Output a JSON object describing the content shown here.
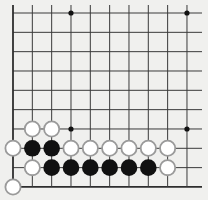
{
  "board": {
    "view": "bottom-left corner fragment",
    "columns": 10,
    "rows": 10,
    "origin_x": 13,
    "origin_y": 13,
    "step": 19.33,
    "line_right": 202,
    "line_top": 5,
    "edges": [
      "left",
      "bottom"
    ],
    "colors": {
      "background": "#f0f0ee",
      "line": "#3a3a3a",
      "edge_line": "#2e2e2e",
      "black_stone": "#111111",
      "white_stone_fill": "#ffffff",
      "white_stone_stroke": "#9a9a9a",
      "star": "#111111"
    },
    "star_points": [
      {
        "col": 3,
        "row": 0
      },
      {
        "col": 9,
        "row": 0
      },
      {
        "col": 3,
        "row": 6
      },
      {
        "col": 9,
        "row": 6
      }
    ],
    "stones": [
      {
        "color": "white",
        "col": 1,
        "row": 6
      },
      {
        "color": "white",
        "col": 2,
        "row": 6
      },
      {
        "color": "white",
        "col": 0,
        "row": 7
      },
      {
        "color": "black",
        "col": 1,
        "row": 7
      },
      {
        "color": "black",
        "col": 2,
        "row": 7
      },
      {
        "color": "white",
        "col": 3,
        "row": 7
      },
      {
        "color": "white",
        "col": 4,
        "row": 7
      },
      {
        "color": "white",
        "col": 5,
        "row": 7
      },
      {
        "color": "white",
        "col": 6,
        "row": 7
      },
      {
        "color": "white",
        "col": 7,
        "row": 7
      },
      {
        "color": "white",
        "col": 8,
        "row": 7
      },
      {
        "color": "white",
        "col": 1,
        "row": 8
      },
      {
        "color": "black",
        "col": 2,
        "row": 8
      },
      {
        "color": "black",
        "col": 3,
        "row": 8
      },
      {
        "color": "black",
        "col": 4,
        "row": 8
      },
      {
        "color": "black",
        "col": 5,
        "row": 8
      },
      {
        "color": "black",
        "col": 6,
        "row": 8
      },
      {
        "color": "black",
        "col": 7,
        "row": 8
      },
      {
        "color": "white",
        "col": 8,
        "row": 8
      },
      {
        "color": "white",
        "col": 0,
        "row": 9
      }
    ]
  }
}
